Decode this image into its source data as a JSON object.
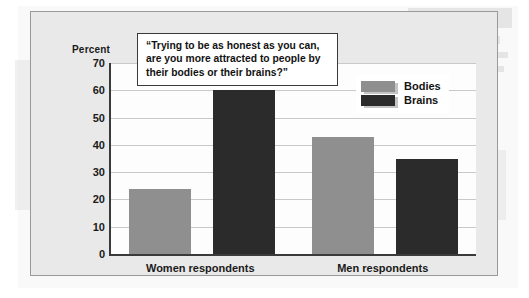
{
  "figure": {
    "percent_axis_label": "Percent",
    "callout_quote": "“Trying to be as honest as you can, are you more attracted to people by their bodies or their brains?”"
  },
  "colors": {
    "bodies": "#8f8f8f",
    "brains": "#2b2b2b",
    "plot_background": "#fdfdfd",
    "figure_background": "#e9e9e9",
    "gridline": "#c9c9c9",
    "axis": "#3a3a3a"
  },
  "chart_data": {
    "type": "bar",
    "title": "",
    "subtitle": "",
    "xlabel": "",
    "ylabel": "Percent",
    "ylim": [
      0,
      70
    ],
    "yticks": [
      0,
      10,
      20,
      30,
      40,
      50,
      60,
      70
    ],
    "ytick_labels": [
      "0",
      "10",
      "20",
      "30",
      "40",
      "50",
      "60",
      "70"
    ],
    "grid": true,
    "legend_position": "upper right",
    "categories": [
      "Women respondents",
      "Men respondents"
    ],
    "series": [
      {
        "name": "Bodies",
        "color": "#8f8f8f",
        "values": [
          24,
          43
        ]
      },
      {
        "name": "Brains",
        "color": "#2b2b2b",
        "values": [
          60,
          35
        ]
      }
    ],
    "annotations": [
      {
        "type": "callout",
        "text": "“Trying to be as honest as you can, are you more attracted to people by their bodies or their brains?”"
      }
    ]
  }
}
